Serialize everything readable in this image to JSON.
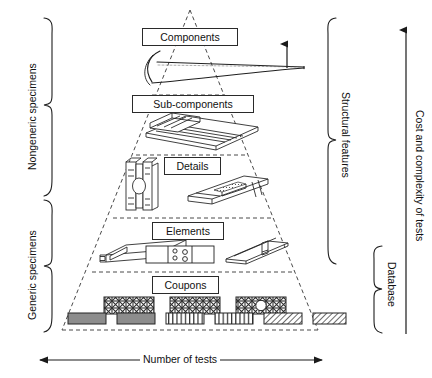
{
  "figure": {
    "type": "building-block-test-pyramid"
  },
  "pyramid": {
    "tiers": [
      {
        "key": "components",
        "label": "Components",
        "order": 1,
        "specimens": [
          "aircraft-wing-section"
        ]
      },
      {
        "key": "sub_components",
        "label": "Sub-components",
        "order": 2,
        "specimens": [
          "stiffened-panel"
        ]
      },
      {
        "key": "details",
        "label": "Details",
        "order": 3,
        "specimens": [
          "bolted-fitting",
          "hat-stiffener-joint"
        ]
      },
      {
        "key": "elements",
        "label": "Elements",
        "order": 4,
        "specimens": [
          "box-beam",
          "bolted-joint-plate",
          "angle-stiffener"
        ]
      },
      {
        "key": "coupons",
        "label": "Coupons",
        "order": 5,
        "specimens": [
          "laminate-stack-a",
          "laminate-stack-b",
          "open-hole-laminate",
          "solid-coupon-a",
          "solid-coupon-b",
          "ribbed-coupon-a",
          "ribbed-coupon-b",
          "hatched-coupon-a",
          "hatched-coupon-b"
        ]
      }
    ]
  },
  "brackets": {
    "left": [
      {
        "key": "nongeneric",
        "label": "Nongeneric specimens"
      },
      {
        "key": "generic",
        "label": "Generic specimens"
      }
    ],
    "right": [
      {
        "key": "structural_features",
        "label": "Structural features"
      },
      {
        "key": "database",
        "label": "Database"
      }
    ]
  },
  "axes": {
    "vertical": {
      "label": "Cost and complexity of tests",
      "direction": "up",
      "arrow": "single"
    },
    "horizontal": {
      "label": "Number of tests",
      "direction": "both",
      "arrow": "double"
    },
    "component_arrow": {
      "label": "",
      "direction": "up",
      "arrow": "single"
    }
  },
  "colors": {
    "ink": "#1a1a1a",
    "line": "#2a2a2a",
    "dashed": "#4a4a4a",
    "fill_gray": "#8d8d8d",
    "background": "#ffffff"
  }
}
